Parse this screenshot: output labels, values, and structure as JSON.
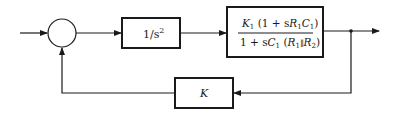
{
  "diagram": {
    "type": "control-system block diagram (feedback loop)",
    "summing_junction": {
      "label": ""
    },
    "blocks": [
      {
        "id": "integrator",
        "numerator": "1/s",
        "exponent": "2",
        "display": "1/s^2"
      },
      {
        "id": "plant",
        "numerator": {
          "K": "K",
          "K_sub": "1",
          "open": " (1 + s",
          "R": "R",
          "R_sub": "1",
          "C": "C",
          "C_sub": "1",
          "close": ")"
        },
        "denominator": {
          "lead": "1 + s",
          "C": "C",
          "C_sub": "1",
          "open": " (",
          "R1": "R",
          "R1_sub": "1",
          "parallel": "∥",
          "R2": "R",
          "R2_sub": "2",
          "close": ")"
        },
        "display": "K1 (1 + sR1C1) / (1 + sC1 (R1 || R2))"
      },
      {
        "id": "feedback",
        "label": "K"
      }
    ],
    "signals": [
      "input",
      "output",
      "feedback"
    ],
    "colors": {
      "line": "#1a1a1a",
      "background": "#ffffff"
    }
  }
}
